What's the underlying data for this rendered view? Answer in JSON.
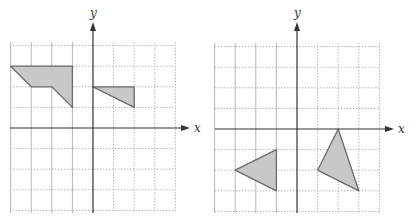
{
  "figure": {
    "colors": {
      "fill": "#c8c8c8",
      "stroke": "#6a6a6a",
      "axis": "#333333",
      "grid": "#b5b5b5"
    },
    "graphs": [
      {
        "id": "left",
        "x_label": "x",
        "y_label": "y",
        "x_range": [
          -4,
          4
        ],
        "y_range": [
          -4,
          4
        ],
        "shapes": [
          {
            "name": "quadrilateral",
            "points": [
              [
                -4,
                3
              ],
              [
                -1,
                3
              ],
              [
                -1,
                1
              ],
              [
                -2,
                2
              ],
              [
                -3,
                2
              ]
            ]
          },
          {
            "name": "triangle",
            "points": [
              [
                0,
                2
              ],
              [
                2,
                2
              ],
              [
                2,
                1
              ]
            ]
          }
        ]
      },
      {
        "id": "right",
        "x_label": "x",
        "y_label": "y",
        "x_range": [
          -4,
          4
        ],
        "y_range": [
          -4,
          4
        ],
        "shapes": [
          {
            "name": "triangle-left",
            "points": [
              [
                -3,
                -2
              ],
              [
                -1,
                -1
              ],
              [
                -1,
                -3
              ]
            ]
          },
          {
            "name": "triangle-right",
            "points": [
              [
                2,
                0
              ],
              [
                1,
                -2
              ],
              [
                3,
                -3
              ]
            ]
          }
        ]
      }
    ]
  }
}
